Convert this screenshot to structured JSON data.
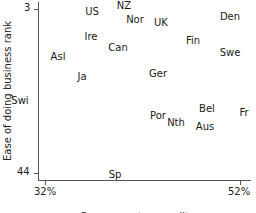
{
  "chart_data": {
    "type": "scatter",
    "title": "",
    "xlabel": "Government expenditures",
    "ylabel": "Ease of doing business rank",
    "xlim": [
      32,
      52
    ],
    "ylim": [
      3,
      44
    ],
    "y_inverted": true,
    "x_ticks": [
      "32%",
      "52%"
    ],
    "y_ticks": [
      "3",
      "44"
    ],
    "grid": false,
    "legend": null,
    "points": [
      {
        "label": "US",
        "x": 36.8,
        "y": 4
      },
      {
        "label": "NZ",
        "x": 40.1,
        "y": 2
      },
      {
        "label": "Nor",
        "x": 41.2,
        "y": 6
      },
      {
        "label": "UK",
        "x": 43.9,
        "y": 6
      },
      {
        "label": "Den",
        "x": 50.9,
        "y": 5
      },
      {
        "label": "Ire",
        "x": 36.7,
        "y": 10
      },
      {
        "label": "Can",
        "x": 39.5,
        "y": 13
      },
      {
        "label": "Fin",
        "x": 47.2,
        "y": 11
      },
      {
        "label": "Swe",
        "x": 50.9,
        "y": 14
      },
      {
        "label": "Asl",
        "x": 33.3,
        "y": 15
      },
      {
        "label": "Ja",
        "x": 35.8,
        "y": 20
      },
      {
        "label": "Ger",
        "x": 43.6,
        "y": 19
      },
      {
        "label": "Swi",
        "x": 30.5,
        "y": 26
      },
      {
        "label": "Por",
        "x": 43.6,
        "y": 30
      },
      {
        "label": "Nth",
        "x": 45.3,
        "y": 31
      },
      {
        "label": "Bel",
        "x": 48.6,
        "y": 28
      },
      {
        "label": "Aus",
        "x": 48.3,
        "y": 32
      },
      {
        "label": "Fr",
        "x": 52.4,
        "y": 29
      },
      {
        "label": "Sp",
        "x": 39.2,
        "y": 44
      }
    ]
  },
  "axes": {
    "x_title": "Government expenditures",
    "y_title": "Ease of doing business rank",
    "x_tick_min": "32%",
    "x_tick_max": "52%",
    "y_tick_top": "3",
    "y_tick_bottom": "44"
  },
  "labels": [
    {
      "text": "US",
      "px": 92,
      "py": 12
    },
    {
      "text": "NZ",
      "px": 124,
      "py": 6
    },
    {
      "text": "Nor",
      "px": 135,
      "py": 20
    },
    {
      "text": "UK",
      "px": 161,
      "py": 23
    },
    {
      "text": "Den",
      "px": 230,
      "py": 17
    },
    {
      "text": "Ire",
      "px": 91,
      "py": 37
    },
    {
      "text": "Can",
      "px": 118,
      "py": 48
    },
    {
      "text": "Fin",
      "px": 193,
      "py": 41
    },
    {
      "text": "Swe",
      "px": 230,
      "py": 53
    },
    {
      "text": "Asl",
      "px": 58,
      "py": 57
    },
    {
      "text": "Ja",
      "px": 82,
      "py": 77
    },
    {
      "text": "Ger",
      "px": 158,
      "py": 74
    },
    {
      "text": "Swi",
      "px": 20,
      "py": 101
    },
    {
      "text": "Por",
      "px": 158,
      "py": 116
    },
    {
      "text": "Nth",
      "px": 176,
      "py": 123
    },
    {
      "text": "Bel",
      "px": 207,
      "py": 109
    },
    {
      "text": "Aus",
      "px": 205,
      "py": 127
    },
    {
      "text": "Fr",
      "px": 244,
      "py": 113
    },
    {
      "text": "Sp",
      "px": 115,
      "py": 175
    }
  ]
}
